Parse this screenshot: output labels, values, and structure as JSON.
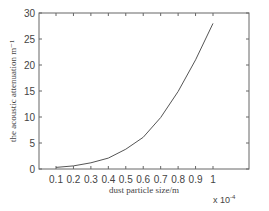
{
  "chart_data": {
    "type": "line",
    "title": "",
    "xlabel": "dust particle size/m",
    "ylabel": "the acoustic attenuation m⁻¹",
    "x_multiplier_label": "x 10",
    "x_multiplier_exp": "-4",
    "x": [
      0.1,
      0.2,
      0.3,
      0.4,
      0.5,
      0.6,
      0.7,
      0.8,
      0.9,
      1.0
    ],
    "series": [
      {
        "name": "acoustic attenuation",
        "values": [
          0.3,
          0.6,
          1.2,
          2.1,
          3.8,
          6.1,
          9.9,
          14.9,
          21.0,
          28.0
        ],
        "color": "#555555"
      }
    ],
    "xticks": [
      "0.1",
      "0.2",
      "0.3",
      "0.4",
      "0.5",
      "0.6",
      "0.7",
      "0.8",
      "0.9",
      "1"
    ],
    "yticks": [
      "0",
      "5",
      "10",
      "15",
      "20",
      "25",
      "30"
    ],
    "xlim": [
      0,
      1.2
    ],
    "ylim": [
      0,
      30
    ],
    "grid": false,
    "legend": false
  }
}
